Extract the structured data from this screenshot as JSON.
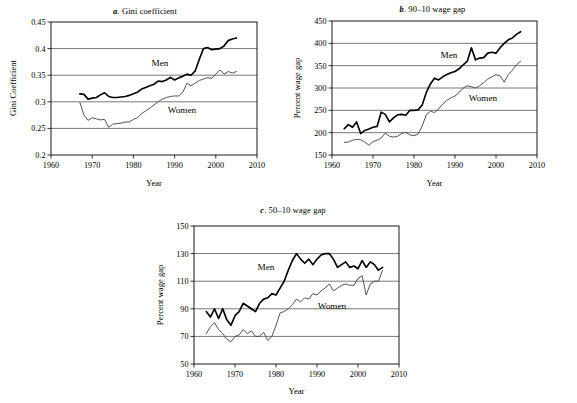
{
  "figure": {
    "panels": [
      "a",
      "b",
      "c"
    ],
    "series_names": [
      "Men",
      "Women"
    ],
    "colors": {
      "men": "#000000",
      "women": "#4a4a4a",
      "grid": "#555555",
      "axis": "#000000"
    }
  },
  "panel_a": {
    "label": "a",
    "title_sep": ". ",
    "title": "Gini coefficient",
    "men_label": "Men",
    "women_label": "Women",
    "xlabel": "Year",
    "ylabel": "Gini Coefficient",
    "xticks": [
      "1960",
      "1970",
      "1980",
      "1990",
      "2000",
      "2010"
    ],
    "yticks": [
      "0.2",
      "0.25",
      "0.3",
      "0.35",
      "0.4",
      "0.45"
    ]
  },
  "panel_b": {
    "label": "b",
    "title_sep": ". ",
    "title": "90–10 wage gap",
    "men_label": "Men",
    "women_label": "Women",
    "xlabel": "Year",
    "ylabel": "Percent wage gap",
    "xticks": [
      "1960",
      "1970",
      "1980",
      "1990",
      "2000",
      "2010"
    ],
    "yticks": [
      "150",
      "200",
      "250",
      "300",
      "350",
      "400",
      "450"
    ]
  },
  "panel_c": {
    "label": "c",
    "title_sep": ". ",
    "title": "50–10 wage gap",
    "men_label": "Men",
    "women_label": "Women",
    "xlabel": "Year",
    "ylabel": "Percent wage gap",
    "xticks": [
      "1960",
      "1970",
      "1980",
      "1990",
      "2000",
      "2010"
    ],
    "yticks": [
      "50",
      "70",
      "90",
      "110",
      "130",
      "150"
    ]
  },
  "chart_data": [
    {
      "id": "panel_a",
      "type": "line",
      "title": "a. Gini coefficient",
      "xlabel": "Year",
      "ylabel": "Gini Coefficient",
      "xlim": [
        1960,
        2010
      ],
      "ylim": [
        0.2,
        0.45
      ],
      "ytick_step": 0.05,
      "xtick_step": 10,
      "grid": "horizontal",
      "legend": "inline-annotations",
      "series": [
        {
          "name": "Men",
          "color": "#000000",
          "x": [
            1967,
            1968,
            1969,
            1970,
            1971,
            1972,
            1973,
            1974,
            1975,
            1976,
            1977,
            1978,
            1979,
            1980,
            1981,
            1982,
            1983,
            1984,
            1985,
            1986,
            1987,
            1988,
            1989,
            1990,
            1991,
            1992,
            1993,
            1994,
            1995,
            1996,
            1997,
            1998,
            1999,
            2000,
            2001,
            2002,
            2003,
            2004,
            2005
          ],
          "values": [
            0.315,
            0.314,
            0.305,
            0.307,
            0.308,
            0.313,
            0.317,
            0.31,
            0.308,
            0.308,
            0.309,
            0.31,
            0.312,
            0.315,
            0.318,
            0.324,
            0.327,
            0.33,
            0.333,
            0.339,
            0.338,
            0.341,
            0.346,
            0.341,
            0.345,
            0.348,
            0.352,
            0.35,
            0.358,
            0.38,
            0.4,
            0.402,
            0.398,
            0.399,
            0.4,
            0.405,
            0.415,
            0.418,
            0.42
          ],
          "note": "Upper bold line; rises from ~0.315 (1967) to ~0.424 (2005)"
        },
        {
          "name": "Women",
          "color": "#4a4a4a",
          "x": [
            1967,
            1968,
            1969,
            1970,
            1971,
            1972,
            1973,
            1974,
            1975,
            1976,
            1977,
            1978,
            1979,
            1980,
            1981,
            1982,
            1983,
            1984,
            1985,
            1986,
            1987,
            1988,
            1989,
            1990,
            1991,
            1992,
            1993,
            1994,
            1995,
            1996,
            1997,
            1998,
            1999,
            2000,
            2001,
            2002,
            2003,
            2004,
            2005
          ],
          "values": [
            0.299,
            0.275,
            0.265,
            0.27,
            0.268,
            0.266,
            0.267,
            0.252,
            0.258,
            0.259,
            0.26,
            0.262,
            0.262,
            0.267,
            0.27,
            0.278,
            0.283,
            0.288,
            0.294,
            0.3,
            0.305,
            0.308,
            0.31,
            0.311,
            0.311,
            0.318,
            0.335,
            0.33,
            0.335,
            0.34,
            0.343,
            0.345,
            0.344,
            0.352,
            0.36,
            0.352,
            0.357,
            0.354,
            0.357
          ],
          "note": "Lower thin line; dips to ~0.25 in 1974 then rises to ~0.357"
        }
      ]
    },
    {
      "id": "panel_b",
      "type": "line",
      "title": "b. 90–10 wage gap",
      "xlabel": "Year",
      "ylabel": "Percent wage gap",
      "xlim": [
        1960,
        2010
      ],
      "ylim": [
        150,
        450
      ],
      "ytick_step": 50,
      "xtick_step": 10,
      "grid": "horizontal",
      "legend": "inline-annotations",
      "series": [
        {
          "name": "Men",
          "color": "#000000",
          "x": [
            1963,
            1964,
            1965,
            1966,
            1967,
            1968,
            1969,
            1970,
            1971,
            1972,
            1973,
            1974,
            1975,
            1976,
            1977,
            1978,
            1979,
            1980,
            1981,
            1982,
            1983,
            1984,
            1985,
            1986,
            1987,
            1988,
            1989,
            1990,
            1991,
            1992,
            1993,
            1994,
            1995,
            1996,
            1997,
            1998,
            1999,
            2000,
            2001,
            2002,
            2003,
            2004,
            2005,
            2006
          ],
          "values": [
            209,
            218,
            212,
            224,
            198,
            205,
            208,
            212,
            214,
            246,
            241,
            224,
            233,
            240,
            241,
            239,
            250,
            250,
            251,
            262,
            290,
            309,
            322,
            318,
            325,
            330,
            334,
            337,
            343,
            352,
            360,
            390,
            363,
            367,
            368,
            378,
            380,
            378,
            390,
            400,
            408,
            412,
            420,
            426
          ],
          "note": "Upper bold line; spike to ~390 in 1994, ends ~426"
        },
        {
          "name": "Women",
          "color": "#4a4a4a",
          "x": [
            1963,
            1964,
            1965,
            1966,
            1967,
            1968,
            1969,
            1970,
            1971,
            1972,
            1973,
            1974,
            1975,
            1976,
            1977,
            1978,
            1979,
            1980,
            1981,
            1982,
            1983,
            1984,
            1985,
            1986,
            1987,
            1988,
            1989,
            1990,
            1991,
            1992,
            1993,
            1994,
            1995,
            1996,
            1997,
            1998,
            1999,
            2000,
            2001,
            2002,
            2003,
            2004,
            2005,
            2006
          ],
          "values": [
            178,
            179,
            183,
            185,
            184,
            179,
            172,
            180,
            183,
            188,
            199,
            192,
            190,
            192,
            198,
            201,
            195,
            193,
            197,
            215,
            240,
            248,
            245,
            253,
            264,
            272,
            278,
            282,
            290,
            300,
            305,
            303,
            300,
            305,
            312,
            320,
            325,
            330,
            327,
            313,
            330,
            340,
            352,
            360
          ],
          "note": "Lower thin line; flat near 180-200 until 1981, rises to ~360"
        }
      ]
    },
    {
      "id": "panel_c",
      "type": "line",
      "title": "c. 50–10 wage gap",
      "xlabel": "Year",
      "ylabel": "Percent wage gap",
      "xlim": [
        1960,
        2010
      ],
      "ylim": [
        50,
        150
      ],
      "ytick_step": 20,
      "xtick_step": 10,
      "grid": "horizontal",
      "legend": "inline-annotations",
      "series": [
        {
          "name": "Men",
          "color": "#000000",
          "x": [
            1963,
            1964,
            1965,
            1966,
            1967,
            1968,
            1969,
            1970,
            1971,
            1972,
            1973,
            1974,
            1975,
            1976,
            1977,
            1978,
            1979,
            1980,
            1981,
            1982,
            1983,
            1984,
            1985,
            1986,
            1987,
            1988,
            1989,
            1990,
            1991,
            1992,
            1993,
            1994,
            1995,
            1996,
            1997,
            1998,
            1999,
            2000,
            2001,
            2002,
            2003,
            2004,
            2005,
            2006
          ],
          "values": [
            88,
            84,
            90,
            83,
            90,
            82,
            78,
            85,
            88,
            94,
            92,
            90,
            88,
            94,
            97,
            98,
            101,
            100,
            105,
            110,
            118,
            125,
            130,
            126,
            123,
            126,
            122,
            126,
            129,
            130,
            130,
            126,
            120,
            122,
            124,
            120,
            121,
            119,
            125,
            120,
            124,
            122,
            118,
            120
          ],
          "note": "Upper bold line; plateau around 120-130 after 1985"
        },
        {
          "name": "Women",
          "color": "#4a4a4a",
          "x": [
            1963,
            1964,
            1965,
            1966,
            1967,
            1968,
            1969,
            1970,
            1971,
            1972,
            1973,
            1974,
            1975,
            1976,
            1977,
            1978,
            1979,
            1980,
            1981,
            1982,
            1983,
            1984,
            1985,
            1986,
            1987,
            1988,
            1989,
            1990,
            1991,
            1992,
            1993,
            1994,
            1995,
            1996,
            1997,
            1998,
            1999,
            2000,
            2001,
            2002,
            2003,
            2004,
            2005,
            2006
          ],
          "values": [
            72,
            77,
            80,
            75,
            72,
            68,
            66,
            70,
            71,
            75,
            72,
            74,
            70,
            70,
            73,
            67,
            70,
            78,
            87,
            88,
            90,
            93,
            97,
            95,
            98,
            97,
            101,
            100,
            103,
            105,
            108,
            103,
            105,
            107,
            108,
            107,
            107,
            112,
            114,
            100,
            108,
            110,
            110,
            118
          ],
          "note": "Lower thin line; rises sharply after 1979, dip in 2002"
        }
      ]
    }
  ]
}
